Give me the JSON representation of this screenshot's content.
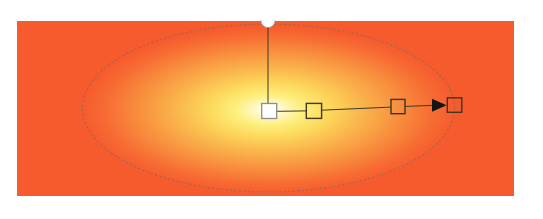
{
  "canvas": {
    "background_color": "#ffffff",
    "description": "pasteboard"
  },
  "artwork": {
    "type": "rectangle-with-radial-gradient",
    "base_color": "#f65b2e",
    "gradient": {
      "type": "radial",
      "shape": "ellipse",
      "stops": [
        {
          "offset": "0%",
          "color": "#fffef4"
        },
        {
          "offset": "7%",
          "color": "#fef9cf"
        },
        {
          "offset": "18%",
          "color": "#fdef7d"
        },
        {
          "offset": "32%",
          "color": "#fcd95c"
        },
        {
          "offset": "50%",
          "color": "#fab54c"
        },
        {
          "offset": "70%",
          "color": "#f88f3e"
        },
        {
          "offset": "88%",
          "color": "#f76c33"
        },
        {
          "offset": "100%",
          "color": "#f65b2e"
        }
      ]
    }
  },
  "gradient_annotator": {
    "axis_line_color": "#3d3a2a",
    "arrow_color": "#141414",
    "spread_ellipse": {
      "stroke": "#8a6a58",
      "style": "dotted"
    },
    "aspect_handle": {
      "shape": "circle-notch",
      "fill": "#ffffff",
      "stroke": "#b9b2a6"
    },
    "center_handle": {
      "shape": "square",
      "fill": "#ffffff",
      "stroke": "#8c8c8c",
      "position": 0
    },
    "color_stops": [
      {
        "shape": "square",
        "fill": "none",
        "stroke": "#3f3626",
        "position": 0.24
      },
      {
        "shape": "square",
        "fill": "none",
        "stroke": "#3f3626",
        "position": 0.69
      }
    ],
    "end_handle": {
      "shape": "square",
      "fill": "none",
      "stroke": "#3f3626",
      "position": 1
    }
  }
}
